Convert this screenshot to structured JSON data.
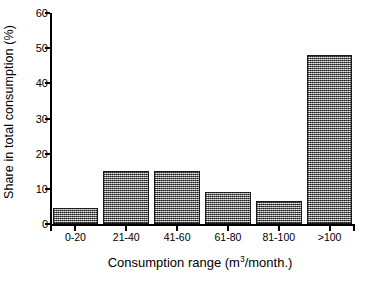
{
  "chart_data": {
    "type": "bar",
    "title": "",
    "categories": [
      "0-20",
      "21-40",
      "41-60",
      "61-80",
      "81-100",
      ">100"
    ],
    "values": [
      4.5,
      15,
      15,
      9,
      6.5,
      48
    ],
    "series": [
      {
        "name": "Share in total consumption",
        "values": [
          4.5,
          15,
          15,
          9,
          6.5,
          48
        ]
      }
    ],
    "xlabel_parts": {
      "before": "Consumption range (m",
      "superscript": "3",
      "after": "/month.)"
    },
    "xlabel": "Consumption range (m3/month.)",
    "ylabel": "Share in total consumption  (%)",
    "ylim": [
      0,
      60
    ],
    "ytick_values": [
      0,
      10,
      20,
      30,
      40,
      50,
      60
    ],
    "ytick_labels": [
      "0",
      "10",
      "20",
      "30",
      "40",
      "50",
      "60"
    ],
    "grid": false,
    "legend": false,
    "legend_position": "none",
    "bar_fill_color": "#8d8d8d",
    "bar_edge_color": "#1a1a1a",
    "background_color": "#ffffff",
    "axis_color": "#000000"
  }
}
